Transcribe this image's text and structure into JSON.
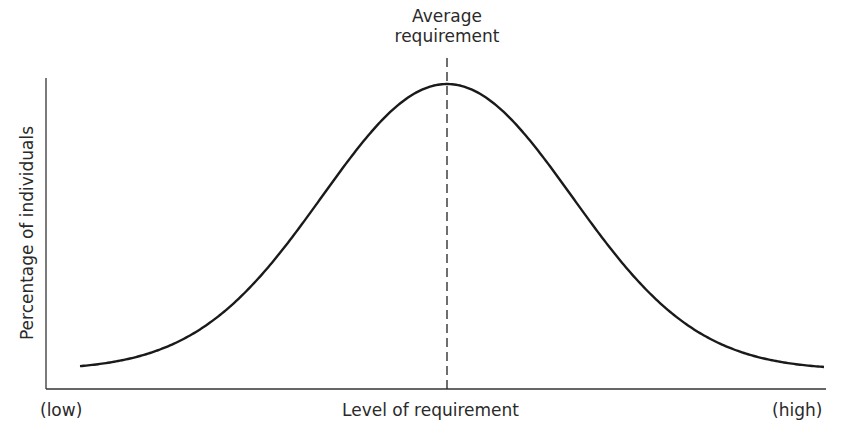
{
  "chart_data": {
    "type": "line",
    "title": "",
    "annotation": {
      "line1": "Average",
      "line2": "requirement",
      "style": "dashed vertical line at mean"
    },
    "xlabel": "Level of requirement",
    "ylabel": "Percentage of individuals",
    "x_tick_labels": {
      "left": "(low)",
      "right": "(high)"
    },
    "distribution": "normal",
    "mean_position": 0.5,
    "series": [
      {
        "name": "Distribution of requirements",
        "shape": "bell curve (normal distribution)"
      }
    ],
    "grid": false,
    "legend": "none"
  },
  "render": {
    "axis_x0": 46,
    "axis_y_top": 78,
    "axis_y_bottom": 389,
    "axis_x_end": 826,
    "curve_x_start": 80,
    "curve_x_end": 825,
    "mean_x": 447,
    "peak_y": 84,
    "baseline_y": 370,
    "sigma_px": 125,
    "dash_top": 58,
    "line_color": "#1a1a1a"
  }
}
